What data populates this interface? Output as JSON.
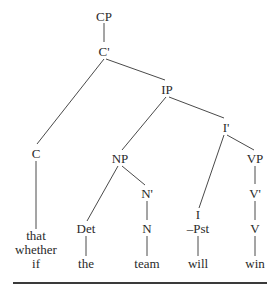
{
  "diagram": {
    "type": "syntax-tree",
    "nodes": {
      "cp": "CP",
      "c_bar": "C'",
      "ip": "IP",
      "i_bar": "I'",
      "c": "C",
      "np": "NP",
      "vp": "VP",
      "n_bar": "N'",
      "v_bar": "V'",
      "i": "I",
      "i_feature": "–Pst",
      "det": "Det",
      "n": "N",
      "v": "V"
    },
    "leaves": {
      "c_words": [
        "that",
        "whether",
        "if"
      ],
      "det_word": "the",
      "n_word": "team",
      "i_word": "will",
      "v_word": "win"
    }
  }
}
